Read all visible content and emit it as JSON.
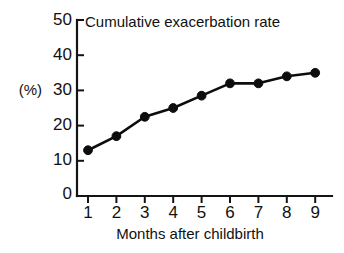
{
  "chart_data": {
    "type": "line",
    "title": "Cumulative exacerbation rate",
    "xlabel": "Months after childbirth",
    "ylabel": "(%)",
    "x": [
      1,
      2,
      3,
      4,
      5,
      6,
      7,
      8,
      9
    ],
    "values": [
      13,
      17,
      22.5,
      25,
      28.5,
      32,
      32,
      34,
      35
    ],
    "categories": [
      "1",
      "2",
      "3",
      "4",
      "5",
      "6",
      "7",
      "8",
      "9"
    ],
    "xtick_labels": [
      "1",
      "2",
      "3",
      "4",
      "5",
      "6",
      "7",
      "8",
      "9"
    ],
    "ytick_labels": [
      "0",
      "10",
      "20",
      "30",
      "40",
      "50"
    ],
    "yticks": [
      0,
      10,
      20,
      30,
      40,
      50
    ],
    "xlim": [
      1,
      9
    ],
    "ylim": [
      0,
      50
    ],
    "grid": false,
    "legend": false,
    "legend_position": "none",
    "marker": "filled-circle",
    "series": [
      {
        "name": "Cumulative exacerbation rate",
        "values": [
          13,
          17,
          22.5,
          25,
          28.5,
          32,
          32,
          34,
          35
        ],
        "color": "#0d0d0d"
      }
    ]
  },
  "colors": {
    "background": "#ffffff",
    "axis": "#141414",
    "line": "#0d0d0d",
    "text": "#111111"
  }
}
